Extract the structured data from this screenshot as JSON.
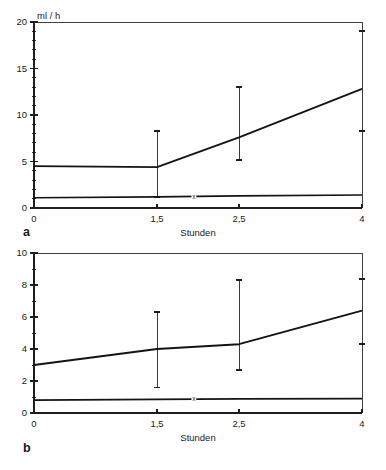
{
  "figure": {
    "title": "",
    "background": "#ffffff",
    "ink_color": "#1a1a1a"
  },
  "panels": [
    {
      "letter": "a",
      "unit_label": "ml / h",
      "xlabel": "Stunden",
      "ylabel": "",
      "xticklabels": [
        "0",
        "1,5",
        "2,5",
        "4"
      ],
      "yticklabels": [
        "0",
        "5",
        "10",
        "15",
        "20"
      ]
    },
    {
      "letter": "b",
      "unit_label": "",
      "xlabel": "Stunden",
      "ylabel": "",
      "xticklabels": [
        "0",
        "1,5",
        "2,5",
        "4"
      ],
      "yticklabels": [
        "0",
        "2",
        "4",
        "6",
        "8",
        "10"
      ]
    }
  ],
  "marker_label": "x",
  "chart_data": [
    {
      "id": "panel-a",
      "type": "line",
      "title": "",
      "subtitle": "",
      "panel_letter": "a",
      "xlabel": "Stunden",
      "ylabel": "ml / h",
      "unit": "ml / h",
      "x": [
        0,
        1.5,
        2.5,
        4
      ],
      "xticks": [
        0,
        1.5,
        2.5,
        4
      ],
      "xticklabels": [
        "0",
        "1,5",
        "2,5",
        "4"
      ],
      "xlim": [
        0,
        4
      ],
      "yticks": [
        0,
        5,
        10,
        15,
        20
      ],
      "yticklabels": [
        "0",
        "5",
        "10",
        "15",
        "20"
      ],
      "yminorticks": [
        1,
        2,
        3,
        4,
        6,
        7,
        8,
        9,
        11,
        12,
        13,
        14,
        16,
        17,
        18,
        19
      ],
      "ylim": [
        0,
        20
      ],
      "grid": false,
      "legend": "none",
      "series": [
        {
          "name": "upper-curve",
          "values": [
            4.5,
            4.4,
            7.6,
            12.8
          ],
          "errorbars": [
            {
              "x": 1.5,
              "low": 1.2,
              "high": 8.3
            },
            {
              "x": 2.5,
              "low": 5.2,
              "high": 13.0
            },
            {
              "x": 4,
              "low": 8.3,
              "high": 19.0
            }
          ]
        },
        {
          "name": "baseline-curve",
          "values": [
            1.1,
            1.2,
            1.3,
            1.4
          ],
          "marker_at_x": 1.95,
          "marker_label": "x",
          "errorbars": []
        }
      ]
    },
    {
      "id": "panel-b",
      "type": "line",
      "title": "",
      "subtitle": "",
      "panel_letter": "b",
      "xlabel": "Stunden",
      "ylabel": "",
      "unit": "",
      "x": [
        0,
        1.5,
        2.5,
        4
      ],
      "xticks": [
        0,
        1.5,
        2.5,
        4
      ],
      "xticklabels": [
        "0",
        "1,5",
        "2,5",
        "4"
      ],
      "xlim": [
        0,
        4
      ],
      "yticks": [
        0,
        2,
        4,
        6,
        8,
        10
      ],
      "yticklabels": [
        "0",
        "2",
        "4",
        "6",
        "8",
        "10"
      ],
      "yminorticks": [
        1,
        3,
        5,
        7,
        9
      ],
      "ylim": [
        0,
        10
      ],
      "grid": false,
      "legend": "none",
      "series": [
        {
          "name": "upper-curve",
          "values": [
            3.0,
            4.0,
            4.3,
            6.4
          ],
          "errorbars": [
            {
              "x": 1.5,
              "low": 1.6,
              "high": 6.3
            },
            {
              "x": 2.5,
              "low": 2.7,
              "high": 8.3
            },
            {
              "x": 4,
              "low": 4.3,
              "high": 8.4
            }
          ]
        },
        {
          "name": "baseline-curve",
          "values": [
            0.8,
            0.85,
            0.88,
            0.9
          ],
          "marker_at_x": 1.95,
          "marker_label": "x",
          "errorbars": []
        }
      ]
    }
  ]
}
